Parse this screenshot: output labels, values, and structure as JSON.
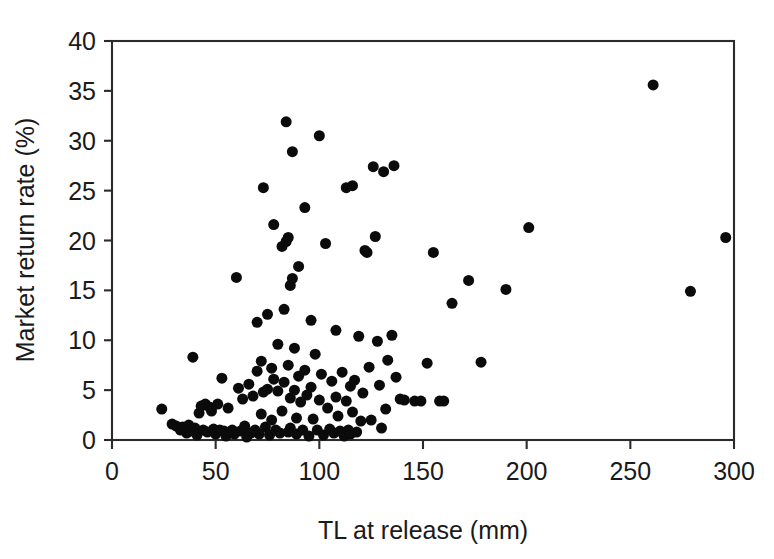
{
  "chart_data": {
    "type": "scatter",
    "title": "",
    "xlabel": "TL at release (mm)",
    "ylabel": "Market return rate (%)",
    "xlim": [
      0,
      300
    ],
    "ylim": [
      0,
      40
    ],
    "xticks": [
      0,
      50,
      100,
      150,
      200,
      250,
      300
    ],
    "yticks": [
      0,
      5,
      10,
      15,
      20,
      25,
      30,
      35,
      40
    ],
    "xtick_labels": [
      "0",
      "50",
      "100",
      "150",
      "200",
      "250",
      "300"
    ],
    "ytick_labels": [
      "0",
      "5",
      "10",
      "15",
      "20",
      "25",
      "30",
      "35",
      "40"
    ],
    "grid": false,
    "legend": null,
    "marker": "filled-circle",
    "marker_color": "#0b0b0b",
    "marker_size_px": 11,
    "n_points": 146,
    "points": [
      [
        24,
        3.1
      ],
      [
        29,
        1.6
      ],
      [
        31,
        1.4
      ],
      [
        33,
        1.0
      ],
      [
        34,
        1.3
      ],
      [
        36,
        0.7
      ],
      [
        37,
        1.5
      ],
      [
        38,
        0.9
      ],
      [
        39,
        8.3
      ],
      [
        40,
        1.2
      ],
      [
        41,
        0.5
      ],
      [
        42,
        2.7
      ],
      [
        43,
        3.4
      ],
      [
        44,
        1.0
      ],
      [
        45,
        3.6
      ],
      [
        46,
        0.8
      ],
      [
        47,
        3.3
      ],
      [
        48,
        2.9
      ],
      [
        49,
        1.1
      ],
      [
        50,
        0.6
      ],
      [
        51,
        3.6
      ],
      [
        52,
        1.0
      ],
      [
        53,
        6.2
      ],
      [
        54,
        0.9
      ],
      [
        55,
        0.4
      ],
      [
        56,
        3.2
      ],
      [
        57,
        0.8
      ],
      [
        58,
        1.0
      ],
      [
        59,
        0.6
      ],
      [
        60,
        16.3
      ],
      [
        61,
        5.2
      ],
      [
        62,
        0.9
      ],
      [
        63,
        4.1
      ],
      [
        64,
        1.4
      ],
      [
        65,
        0.3
      ],
      [
        66,
        5.6
      ],
      [
        67,
        0.7
      ],
      [
        68,
        4.4
      ],
      [
        69,
        1.0
      ],
      [
        70,
        6.9
      ],
      [
        70,
        11.8
      ],
      [
        71,
        0.6
      ],
      [
        72,
        2.6
      ],
      [
        72,
        7.9
      ],
      [
        73,
        25.3
      ],
      [
        73,
        4.8
      ],
      [
        74,
        1.3
      ],
      [
        75,
        5.1
      ],
      [
        75,
        12.6
      ],
      [
        76,
        0.5
      ],
      [
        77,
        7.2
      ],
      [
        77,
        2.0
      ],
      [
        78,
        6.1
      ],
      [
        78,
        21.6
      ],
      [
        79,
        1.0
      ],
      [
        80,
        4.9
      ],
      [
        80,
        9.6
      ],
      [
        81,
        0.7
      ],
      [
        82,
        19.4
      ],
      [
        82,
        2.9
      ],
      [
        83,
        5.8
      ],
      [
        83,
        13.1
      ],
      [
        84,
        31.9
      ],
      [
        84,
        19.9
      ],
      [
        85,
        0.8
      ],
      [
        85,
        7.5
      ],
      [
        85,
        20.3
      ],
      [
        86,
        15.5
      ],
      [
        86,
        4.2
      ],
      [
        86,
        1.2
      ],
      [
        87,
        28.9
      ],
      [
        87,
        16.2
      ],
      [
        88,
        5.0
      ],
      [
        88,
        9.2
      ],
      [
        89,
        0.6
      ],
      [
        89,
        2.2
      ],
      [
        90,
        6.4
      ],
      [
        90,
        17.4
      ],
      [
        91,
        3.8
      ],
      [
        92,
        1.0
      ],
      [
        93,
        7.0
      ],
      [
        93,
        23.3
      ],
      [
        94,
        4.5
      ],
      [
        95,
        0.4
      ],
      [
        96,
        12.0
      ],
      [
        96,
        5.3
      ],
      [
        97,
        2.1
      ],
      [
        98,
        8.6
      ],
      [
        99,
        1.0
      ],
      [
        100,
        4.0
      ],
      [
        100,
        30.5
      ],
      [
        101,
        6.6
      ],
      [
        102,
        0.5
      ],
      [
        103,
        19.7
      ],
      [
        104,
        3.2
      ],
      [
        105,
        1.1
      ],
      [
        106,
        5.9
      ],
      [
        107,
        0.7
      ],
      [
        108,
        11.0
      ],
      [
        108,
        4.3
      ],
      [
        109,
        2.4
      ],
      [
        110,
        0.9
      ],
      [
        111,
        6.8
      ],
      [
        112,
        0.4
      ],
      [
        113,
        25.3
      ],
      [
        113,
        3.9
      ],
      [
        114,
        1.0
      ],
      [
        115,
        0.6
      ],
      [
        115,
        5.4
      ],
      [
        116,
        25.5
      ],
      [
        116,
        2.8
      ],
      [
        117,
        6.0
      ],
      [
        118,
        0.8
      ],
      [
        119,
        10.4
      ],
      [
        120,
        1.9
      ],
      [
        121,
        4.7
      ],
      [
        122,
        19.0
      ],
      [
        123,
        18.8
      ],
      [
        124,
        7.3
      ],
      [
        125,
        2.0
      ],
      [
        126,
        27.4
      ],
      [
        127,
        20.4
      ],
      [
        128,
        9.9
      ],
      [
        129,
        5.5
      ],
      [
        130,
        1.2
      ],
      [
        131,
        26.9
      ],
      [
        132,
        3.1
      ],
      [
        133,
        8.0
      ],
      [
        135,
        10.5
      ],
      [
        136,
        27.5
      ],
      [
        137,
        6.3
      ],
      [
        139,
        4.1
      ],
      [
        141,
        4.0
      ],
      [
        146,
        3.9
      ],
      [
        149,
        3.9
      ],
      [
        152,
        7.7
      ],
      [
        155,
        18.8
      ],
      [
        158,
        3.9
      ],
      [
        160,
        3.9
      ],
      [
        164,
        13.7
      ],
      [
        172,
        16.0
      ],
      [
        178,
        7.8
      ],
      [
        190,
        15.1
      ],
      [
        201,
        21.3
      ],
      [
        261,
        35.6
      ],
      [
        279,
        14.9
      ],
      [
        296,
        20.3
      ]
    ]
  },
  "axes": {
    "y_axis_title": "Market return rate (%)",
    "x_axis_title": "TL at release (mm)"
  }
}
